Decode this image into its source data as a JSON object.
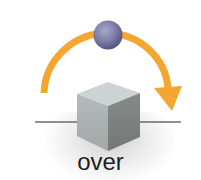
{
  "diagram": {
    "type": "preposition-illustration",
    "label": "over",
    "elements": {
      "ball": {
        "shape": "sphere",
        "color": "#7a7aa6"
      },
      "path_arrow": {
        "shape": "curved-arrow",
        "direction": "left-to-right-over",
        "color": "#f4a630"
      },
      "object": {
        "shape": "cube",
        "colors": {
          "top": "#c9cfd2",
          "left": "#a9aeb0",
          "right": "#7d8380"
        }
      },
      "ground_line": {
        "color": "#6b6b6b"
      }
    }
  }
}
